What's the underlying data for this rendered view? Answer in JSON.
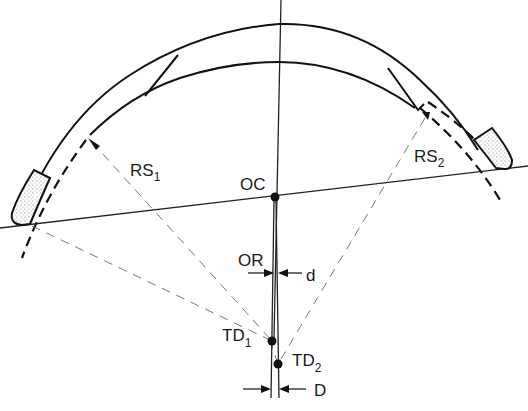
{
  "figure": {
    "labels": {
      "rs1": "RS",
      "rs1_sub": "1",
      "rs2": "RS",
      "rs2_sub": "2",
      "oc": "OC",
      "or": "OR",
      "d_small": "d",
      "td1": "TD",
      "td1_sub": "1",
      "td2": "TD",
      "td2_sub": "2",
      "d_large": "D"
    },
    "colors": {
      "line": "#111111",
      "dashed_construction": "#777777",
      "pad_fill": "#d9d9d9",
      "background": "#ffffff"
    }
  }
}
